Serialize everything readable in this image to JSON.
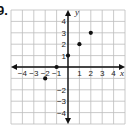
{
  "problem_label": "9.",
  "chart_data": {
    "type": "scatter",
    "title": "",
    "xlabel": "x",
    "ylabel": "y",
    "xlim": [
      -5,
      5
    ],
    "ylim": [
      -5,
      5
    ],
    "grid": true,
    "x_ticks": [
      -4,
      -3,
      -2,
      -1,
      1,
      2,
      3,
      4
    ],
    "y_ticks": [
      -4,
      -3,
      -2,
      1,
      2,
      3,
      4
    ],
    "x_tick_labels": [
      "−4",
      "−3",
      "−2",
      "−1",
      "1",
      "2",
      "3",
      "4"
    ],
    "y_tick_labels": [
      "−4",
      "−3",
      "−2",
      "1",
      "2",
      "3",
      "4"
    ],
    "points": [
      {
        "x": -2,
        "y": -1
      },
      {
        "x": -1,
        "y": 0
      },
      {
        "x": 0,
        "y": 1
      },
      {
        "x": 1,
        "y": 2
      },
      {
        "x": 2,
        "y": 3
      }
    ]
  }
}
